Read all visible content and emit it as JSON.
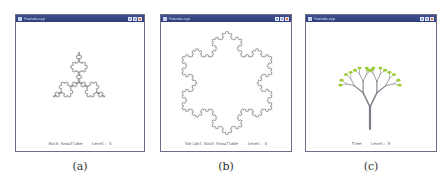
{
  "windows": [
    {
      "title": "Fractals.cyp",
      "status": "Koch Snowflake    Level: 4",
      "fractal": "koch-snowflake",
      "caption": "(a)"
    },
    {
      "title": "Fractals.cyp",
      "status": "Variant Koch Snowflake    Level: 4",
      "fractal": "variant-koch-snowflake",
      "caption": "(b)"
    },
    {
      "title": "Fractals.cyp",
      "status": "Tree    Level: 5",
      "fractal": "tree",
      "caption": "(c)",
      "colors": {
        "trunk": "#7a7f86",
        "leaf": "#9acd32"
      }
    }
  ]
}
